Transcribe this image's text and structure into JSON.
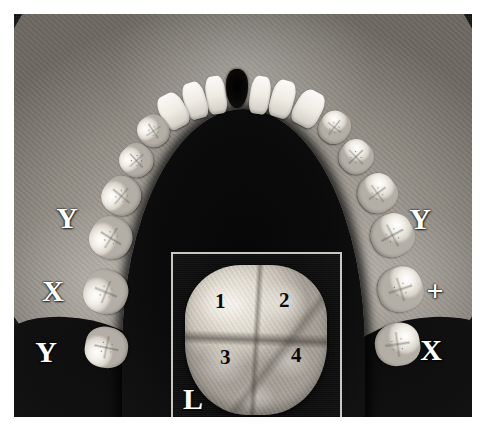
{
  "figure": {
    "type": "photograph",
    "modality": "grayscale photograph",
    "background_color": "#0a0a0a",
    "plate_border_color": "#ffffff"
  },
  "annotations": {
    "left_side": [
      {
        "label": "Y",
        "x": 66,
        "y": 218
      },
      {
        "label": "X",
        "x": 52,
        "y": 291
      },
      {
        "label": "Y",
        "x": 45,
        "y": 352
      }
    ],
    "right_side": [
      {
        "label": "Y",
        "x": 419,
        "y": 219
      },
      {
        "label": "+",
        "x": 434,
        "y": 291
      },
      {
        "label": "X",
        "x": 430,
        "y": 350
      }
    ]
  },
  "inset": {
    "border_color": "#c9c9c4",
    "side_label": "L",
    "subject": "molar occlusal surface",
    "cusp_labels": [
      {
        "label": "1",
        "x": 48,
        "y": 48
      },
      {
        "label": "2",
        "x": 112,
        "y": 47
      },
      {
        "label": "3",
        "x": 53,
        "y": 104
      },
      {
        "label": "4",
        "x": 124,
        "y": 102
      }
    ]
  },
  "teeth": {
    "left_arch": [
      {
        "name": "left-incisor-1",
        "x": 192,
        "y": 62,
        "w": 20,
        "h": 38,
        "rot": -8,
        "type": "incisor"
      },
      {
        "name": "left-incisor-2",
        "x": 170,
        "y": 68,
        "w": 22,
        "h": 37,
        "rot": -16,
        "type": "incisor"
      },
      {
        "name": "left-canine",
        "x": 146,
        "y": 79,
        "w": 26,
        "h": 36,
        "rot": -28,
        "type": "incisor"
      },
      {
        "name": "left-premolar-1",
        "x": 124,
        "y": 101,
        "w": 31,
        "h": 32,
        "rot": -36,
        "type": "tooth"
      },
      {
        "name": "left-premolar-2",
        "x": 106,
        "y": 130,
        "w": 33,
        "h": 33,
        "rot": -44,
        "type": "tooth"
      },
      {
        "name": "left-molar-1",
        "x": 88,
        "y": 163,
        "w": 39,
        "h": 38,
        "rot": -52,
        "type": "tooth"
      },
      {
        "name": "left-molar-2",
        "x": 76,
        "y": 203,
        "w": 42,
        "h": 42,
        "rot": -60,
        "type": "tooth"
      },
      {
        "name": "left-molar-3",
        "x": 70,
        "y": 256,
        "w": 44,
        "h": 44,
        "rot": -70,
        "type": "tooth"
      },
      {
        "name": "left-molar-4",
        "x": 72,
        "y": 312,
        "w": 41,
        "h": 43,
        "rot": -80,
        "type": "tooth"
      }
    ],
    "right_arch": [
      {
        "name": "right-incisor-1",
        "x": 236,
        "y": 62,
        "w": 20,
        "h": 38,
        "rot": 8,
        "type": "incisor"
      },
      {
        "name": "right-incisor-2",
        "x": 257,
        "y": 66,
        "w": 23,
        "h": 38,
        "rot": 16,
        "type": "incisor"
      },
      {
        "name": "right-canine",
        "x": 281,
        "y": 76,
        "w": 27,
        "h": 37,
        "rot": 28,
        "type": "incisor"
      },
      {
        "name": "right-premolar-1",
        "x": 305,
        "y": 97,
        "w": 31,
        "h": 33,
        "rot": 36,
        "type": "tooth"
      },
      {
        "name": "right-premolar-2",
        "x": 325,
        "y": 126,
        "w": 34,
        "h": 34,
        "rot": 44,
        "type": "tooth"
      },
      {
        "name": "right-molar-1",
        "x": 344,
        "y": 160,
        "w": 39,
        "h": 39,
        "rot": 52,
        "type": "tooth"
      },
      {
        "name": "right-molar-2",
        "x": 357,
        "y": 200,
        "w": 43,
        "h": 43,
        "rot": 60,
        "type": "tooth"
      },
      {
        "name": "right-molar-3",
        "x": 364,
        "y": 253,
        "w": 45,
        "h": 45,
        "rot": 70,
        "type": "tooth"
      },
      {
        "name": "right-molar-4",
        "x": 362,
        "y": 308,
        "w": 43,
        "h": 45,
        "rot": 80,
        "type": "tooth"
      }
    ]
  }
}
